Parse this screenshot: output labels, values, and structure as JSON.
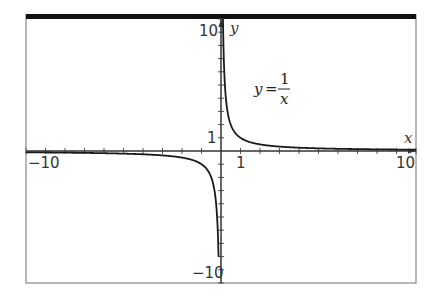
{
  "chart_data": {
    "type": "line",
    "title": "",
    "function": "y = 1/x",
    "annotation": {
      "lhs": "y",
      "eq": "=",
      "numerator": "1",
      "denominator": "x"
    },
    "xlabel": "x",
    "ylabel": "y",
    "xlim": [
      -10,
      10
    ],
    "ylim": [
      -10,
      10
    ],
    "grid": false,
    "legend": "none",
    "x_tick_labels": [
      {
        "value": -10,
        "label": "-10"
      },
      {
        "value": 1,
        "label": "1"
      },
      {
        "value": 10,
        "label": "10"
      }
    ],
    "y_tick_labels": [
      {
        "value": 10,
        "label": "10"
      },
      {
        "value": 1,
        "label": "1"
      },
      {
        "value": -10,
        "label": "-10"
      }
    ],
    "tick_step": 1,
    "series": [
      {
        "name": "y = 1/x (x>0)",
        "x": [
          0.1,
          0.125,
          0.2,
          0.25,
          0.5,
          1,
          2,
          3,
          4,
          5,
          6,
          7,
          8,
          9,
          10
        ],
        "y": [
          10,
          8,
          5,
          4,
          2,
          1,
          0.5,
          0.333,
          0.25,
          0.2,
          0.167,
          0.143,
          0.125,
          0.111,
          0.1
        ]
      },
      {
        "name": "y = 1/x (x<0)",
        "x": [
          -10,
          -9,
          -8,
          -7,
          -6,
          -5,
          -4,
          -3,
          -2,
          -1,
          -0.5,
          -0.25,
          -0.2,
          -0.125,
          -0.1
        ],
        "y": [
          -0.1,
          -0.111,
          -0.125,
          -0.143,
          -0.167,
          -0.2,
          -0.25,
          -0.333,
          -0.5,
          -1,
          -2,
          -4,
          -5,
          -8,
          -10
        ]
      }
    ]
  },
  "colors": {
    "curve": "#1a1a1a",
    "axes": "#333333",
    "frame": "#888888",
    "top_bar": "#111111"
  }
}
